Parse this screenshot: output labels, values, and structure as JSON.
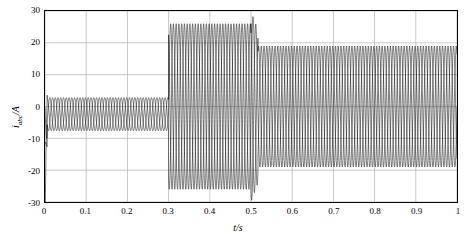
{
  "chart_data": {
    "type": "line",
    "title": "",
    "xlabel": "t/s",
    "ylabel_main": "i",
    "ylabel_sub": "abc",
    "ylabel_unit": "/A",
    "xlim": [
      0,
      1
    ],
    "ylim": [
      -30,
      30
    ],
    "xticks": [
      0,
      0.1,
      0.2,
      0.3,
      0.4,
      0.5,
      0.6,
      0.7,
      0.8,
      0.9,
      1
    ],
    "xtick_labels": [
      "0",
      "0.1",
      "0.2",
      "0.3",
      "0.4",
      "0.5",
      "0.6",
      "0.7",
      "0.8",
      "0.9",
      "1"
    ],
    "yticks": [
      -30,
      -20,
      -10,
      0,
      10,
      20,
      30
    ],
    "ytick_labels": [
      "-30",
      "-20",
      "-10",
      "0",
      "10",
      "20",
      "30"
    ],
    "grid": true,
    "grid_color": "#b0b0b0",
    "line_color": "#000000",
    "series_description": "Three-phase current iabc versus time, oscillatory waveform with amplitude changing at segment boundaries",
    "segments": [
      {
        "t_start": 0.0,
        "t_end": 0.006,
        "amplitude": 30,
        "note": "initial transient spike down to -30"
      },
      {
        "t_start": 0.006,
        "t_end": 0.3,
        "amplitude": 5,
        "note": "low amplitude steady state, envelope about -10 to 5"
      },
      {
        "t_start": 0.3,
        "t_end": 0.5,
        "amplitude": 26,
        "note": "large oscillation envelope about -26 to 26"
      },
      {
        "t_start": 0.5,
        "t_end": 0.515,
        "amplitude": 30,
        "note": "transient spike, envelope -30 to 30"
      },
      {
        "t_start": 0.515,
        "t_end": 1.0,
        "amplitude": 19,
        "note": "steady oscillation envelope about -19 to 19"
      }
    ],
    "frequency_hz": 50,
    "phases": 3
  }
}
